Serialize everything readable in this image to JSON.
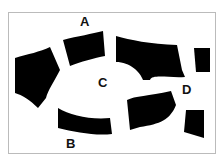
{
  "labels": {
    "a": "A",
    "b": "B",
    "c": "C",
    "d": "D"
  },
  "colors": {
    "water": "#000000",
    "land": "#ffffff",
    "frame": "#bbbbbb"
  }
}
